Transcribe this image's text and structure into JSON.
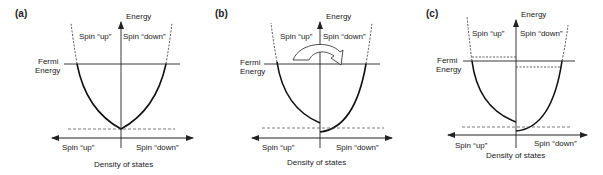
{
  "figure": {
    "panels": [
      {
        "id": "a",
        "label": "(a)",
        "y_axis_label": "Energy",
        "fermi_label_line1": "Fermi",
        "fermi_label_line2": "Energy",
        "top_left_label": "Spin “up”",
        "top_right_label": "Spin “down”",
        "bottom_left_label": "Spin “up”",
        "bottom_right_label": "Spin “down”",
        "x_axis_label": "Density of states",
        "description": "Unpolarized: identical spin-up and spin-down bands filled to the same Fermi energy"
      },
      {
        "id": "b",
        "label": "(b)",
        "y_axis_label": "Energy",
        "fermi_label_line1": "Fermi",
        "fermi_label_line2": "Energy",
        "top_left_label": "Spin “up”",
        "top_right_label": "Spin “down”",
        "bottom_left_label": "Spin “up”",
        "bottom_right_label": "Spin “down”",
        "x_axis_label": "Density of states",
        "description": "Exchange splitting shifts spin-up band up and spin-down band down; curved arrow indicates electron transfer from up to down"
      },
      {
        "id": "c",
        "label": "(c)",
        "y_axis_label": "Energy",
        "fermi_label_line1": "Fermi",
        "fermi_label_line2": "Energy",
        "top_left_label": "Spin “up”",
        "top_right_label": "Spin “down”",
        "bottom_left_label": "Spin “up”",
        "bottom_right_label": "Spin “down”",
        "x_axis_label": "Density of states",
        "description": "Equilibrium: common Fermi energy with dashed lines marking previous band-filling levels"
      }
    ]
  }
}
